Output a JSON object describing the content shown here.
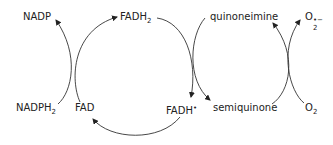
{
  "diagram": {
    "type": "redox-cycle",
    "nodes": {
      "nadp": {
        "text": "NADP"
      },
      "fadh2": {
        "text": "FADH",
        "sub": "2"
      },
      "quinoneimine": {
        "text": "quinoneimine"
      },
      "superoxide": {
        "text": "O",
        "sub": "2",
        "sup": "•−"
      },
      "nadph2": {
        "text": "NADPH",
        "sub": "2"
      },
      "fad": {
        "text": "FAD"
      },
      "fadh_radical": {
        "text": "FADH",
        "sup": "•"
      },
      "semiquinone": {
        "text": "semiquinone"
      },
      "oxygen": {
        "text": "O",
        "sub": "2"
      }
    },
    "edges": [
      {
        "from": "nadph2",
        "to": "nadp",
        "note": "coupled with FAD → FADH2"
      },
      {
        "from": "fad",
        "to": "fadh2"
      },
      {
        "from": "fadh2",
        "to": "fadh_radical",
        "note": "coupled with quinoneimine → semiquinone"
      },
      {
        "from": "quinoneimine",
        "to": "semiquinone"
      },
      {
        "from": "semiquinone",
        "to": "quinoneimine",
        "note": "coupled with O2 → O2•−"
      },
      {
        "from": "oxygen",
        "to": "superoxide"
      },
      {
        "from": "fadh_radical",
        "to": "fad"
      }
    ],
    "colors": {
      "line": "#333333",
      "text": "#222222"
    }
  }
}
